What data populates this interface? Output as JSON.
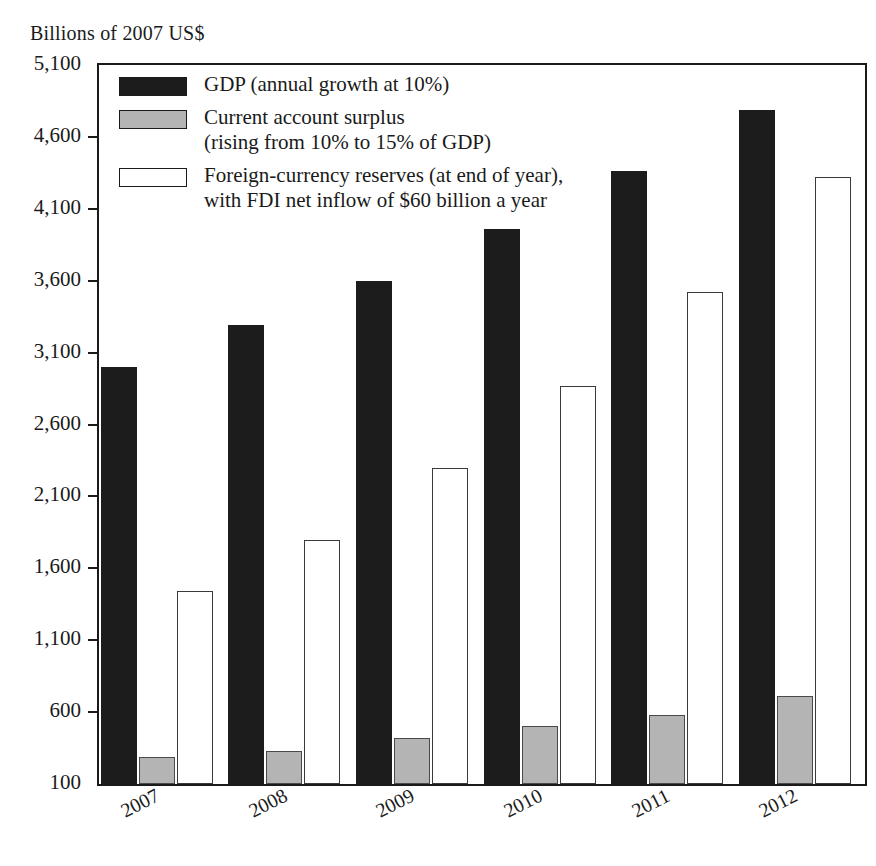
{
  "chart_data": {
    "type": "bar",
    "title": "",
    "subtitle": "",
    "ylabel": "Billions of 2007 US$",
    "xlabel": "",
    "categories": [
      "2007",
      "2008",
      "2009",
      "2010",
      "2011",
      "2012"
    ],
    "ylim": [
      100,
      5100
    ],
    "ytick_step": 500,
    "ytick_labels": [
      "5,100",
      "4,600",
      "4,100",
      "3,600",
      "3,100",
      "2,600",
      "2,100",
      "1,600",
      "1,100",
      "600",
      "100"
    ],
    "ytick_values": [
      5100,
      4600,
      4100,
      3600,
      3100,
      2600,
      2100,
      1600,
      1100,
      600,
      100
    ],
    "grid": false,
    "legend_position": "inside-top-left",
    "series": [
      {
        "name": "GDP (annual growth at 10%)",
        "key": "gdp",
        "color": "#1c1c1c",
        "values": [
          3000,
          3290,
          3600,
          3960,
          4360,
          4790
        ]
      },
      {
        "name": "Current account surplus\n(rising from 10% to 15% of GDP)",
        "key": "surplus",
        "color": "#b4b4b4",
        "values": [
          290,
          330,
          420,
          500,
          580,
          710
        ]
      },
      {
        "name": "Foreign-currency reserves (at end of year),\nwith FDI net inflow of $60 billion a year",
        "key": "reserves",
        "color": "#ffffff",
        "values": [
          1440,
          1800,
          2300,
          2870,
          3520,
          4320
        ]
      }
    ]
  },
  "legend": {
    "items": [
      {
        "label": "GDP (annual growth at 10%)",
        "swatch": "black"
      },
      {
        "label": "Current account surplus\n(rising from 10% to 15% of GDP)",
        "swatch": "gray"
      },
      {
        "label": "Foreign-currency reserves (at end of year),\nwith FDI net inflow of $60 billion a year",
        "swatch": "white"
      }
    ]
  }
}
